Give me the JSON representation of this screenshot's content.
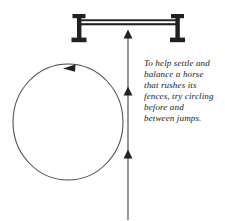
{
  "figure": {
    "title": "Circling before and between jumps",
    "background_color": "#ffffff",
    "ink_color": "#231f20",
    "stroke_color": "#4a4a4a"
  },
  "caption": {
    "full_text": "To help settle and balance a horse that rushes its fences, try circling before and between jumps.",
    "lines": [
      "To help settle and",
      "balance a horse",
      "that rushes its",
      "fences, try circling",
      "before and",
      "between jumps."
    ]
  },
  "elements": {
    "jump": {
      "label": "jump-fence",
      "left_post_x": 76,
      "right_post_x": 176,
      "post_top_y": 14,
      "post_bottom_y": 42,
      "rail_y_upper": 20,
      "rail_y_lower": 25,
      "color": "#231f20"
    },
    "circle": {
      "label": "circling-path",
      "center_x": 68,
      "center_y": 122,
      "radius_x": 55,
      "radius_y": 58,
      "direction": "counterclockwise",
      "arrow_position": "top",
      "arrow_direction": "left",
      "color": "#4a4a4a"
    },
    "approach_line": {
      "label": "approach-track",
      "x": 128,
      "start_y": 220,
      "end_y": 30,
      "direction": "up",
      "arrowheads_y": [
        32,
        92,
        155
      ],
      "color": "#4a4a4a"
    }
  }
}
